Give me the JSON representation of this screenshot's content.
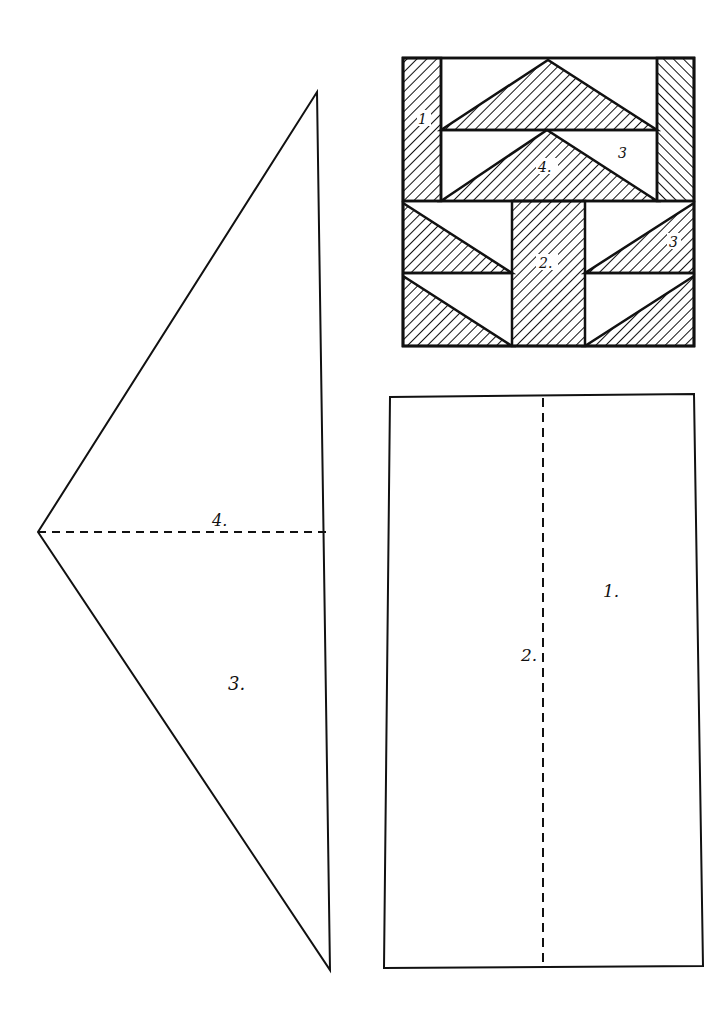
{
  "diagram": {
    "type": "quilt-block-pattern",
    "block_preview": {
      "labels": {
        "piece1": "1",
        "piece2": "2.",
        "piece3a": "3",
        "piece3b": "3",
        "piece4": "4."
      }
    },
    "template_triangle": {
      "label_piece4": "4.",
      "label_piece3": "3."
    },
    "template_rectangle": {
      "label_piece1": "1.",
      "label_piece2": "2."
    },
    "colors": {
      "line": "#111111",
      "background": "#ffffff"
    }
  }
}
